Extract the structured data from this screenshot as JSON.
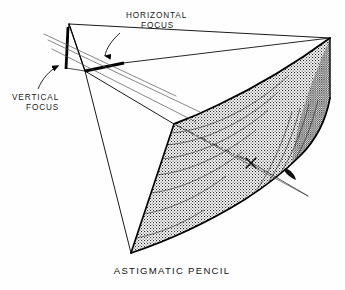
{
  "figure": {
    "caption": "ASTIGMATIC PENCIL",
    "background_color": "#fefefe",
    "ink_color": "#000000",
    "annotations": [
      {
        "id": "horizontal-focus",
        "line1": "HORIZONTAL",
        "line2": "FOCUS",
        "text_x": 126,
        "text_y": 18,
        "text_y2": 28,
        "leader": "M 120 32 C 110 40 106 48 105 57",
        "arrow_tip_x": 105,
        "arrow_tip_y": 62
      },
      {
        "id": "vertical-focus",
        "line1": "VERTICAL",
        "line2": "FOCUS",
        "text_x": 12,
        "text_y": 99,
        "text_y2": 109,
        "leader": "M 37 88 C 42 78 50 70 60 66",
        "arrow_tip_x": 66,
        "arrow_tip_y": 63
      }
    ],
    "geometry": {
      "apex_top": [
        69,
        23
      ],
      "apex_bottom_left": [
        85,
        72
      ],
      "vertical_focus_line": [
        [
          68,
          27
        ],
        [
          66,
          68
        ]
      ],
      "horizontal_focus_line": [
        [
          85,
          70
        ],
        [
          123,
          63
        ]
      ],
      "surface_top_right": [
        330,
        38
      ],
      "surface_mid_left": [
        174,
        124
      ],
      "surface_bottom": [
        131,
        253
      ],
      "surface_right_lower": [
        288,
        176
      ],
      "exit_ray_end": [
        308,
        196
      ],
      "cross_mark": [
        251,
        163
      ],
      "ray_count": 4,
      "ruling_count": 11
    },
    "shading": {
      "style": "stipple-dot",
      "dot_color": "#2a2a2a",
      "dot_spacing_px": 2
    }
  }
}
